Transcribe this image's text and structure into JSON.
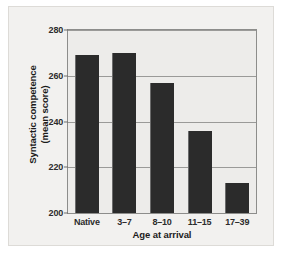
{
  "chart_data": {
    "type": "bar",
    "title": "",
    "subtitle": "",
    "xlabel": "Age at arrival",
    "ylabel_line1": "Syntactic competence",
    "ylabel_line2": "(mean score)",
    "categories": [
      "Native",
      "3–7",
      "8–10",
      "11–15",
      "17–39"
    ],
    "values": [
      269,
      270,
      257,
      236,
      213
    ],
    "ylim": [
      200,
      280
    ],
    "yticks": [
      200,
      220,
      240,
      260,
      280
    ],
    "ytick_labels": [
      "200",
      "220",
      "240",
      "260",
      "280"
    ],
    "grid": "horizontal",
    "legend": "none",
    "series": [
      {
        "name": "Syntactic competence (mean score)",
        "values": [
          269,
          270,
          257,
          236,
          213
        ]
      }
    ]
  },
  "style": {
    "bar_color": "#2b2b2b",
    "plot_background": "#edecea",
    "card_background": "#f2f1ef",
    "gridline_color": "#9a9a98",
    "frame_color": "#8d8d8b",
    "text_color": "#1b1b1b"
  }
}
